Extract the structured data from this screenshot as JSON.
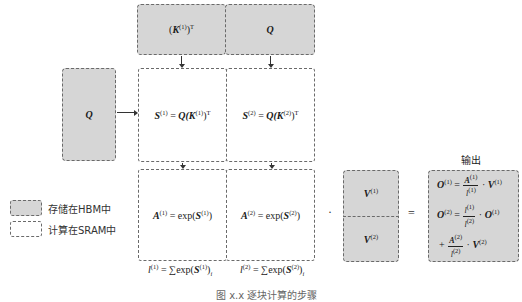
{
  "diagram": {
    "top_row": [
      {
        "text": "(K",
        "sup": "(1)",
        "close": ")",
        "sup2": "T"
      },
      {
        "text": "Q"
      }
    ],
    "left_input": {
      "text": "Q"
    },
    "s_row": [
      {
        "lhs": "S",
        "lhs_sup": "(1)",
        "eq": " = ",
        "rhs_a": "Q(K",
        "rhs_sup": "(1)",
        "rhs_close": ")",
        "rhs_sup2": "T"
      },
      {
        "lhs": "S",
        "lhs_sup": "(2)",
        "eq": " = ",
        "rhs_a": "Q(K",
        "rhs_sup": "(2)",
        "rhs_close": ")",
        "rhs_sup2": "T"
      }
    ],
    "a_row": [
      {
        "lhs": "A",
        "lhs_sup": "(1)",
        "eq": " = exp(",
        "arg": "S",
        "arg_sup": "(1)",
        "close": ")"
      },
      {
        "lhs": "A",
        "lhs_sup": "(2)",
        "eq": " = exp(",
        "arg": "S",
        "arg_sup": "(2)",
        "close": ")"
      }
    ],
    "l_formulas": [
      {
        "lhs": "l",
        "lhs_sup": "(1)",
        "eq": " = ∑exp(",
        "arg": "S",
        "arg_sup": "(1)",
        "close": ")",
        "sub": "i",
        "sum_sub": "i"
      },
      {
        "lhs": "l",
        "lhs_sup": "(2)",
        "eq": " = ∑exp(",
        "arg": "S",
        "arg_sup": "(2)",
        "close": ")",
        "sub": "i",
        "sum_sub": "i"
      }
    ],
    "dot_operator": "·",
    "equals_operator": "=",
    "v_blocks": [
      {
        "text": "V",
        "sup": "(1)"
      },
      {
        "text": "V",
        "sup": "(2)"
      }
    ],
    "output": {
      "title": "输出",
      "line1": {
        "lhs": "O",
        "lhs_sup": "(1)",
        "eq": " = ",
        "num": "A",
        "num_sup": "(1)",
        "den": "l",
        "den_sup": "(1)",
        "mul": " · ",
        "v": "V",
        "v_sup": "(1)"
      },
      "line2": {
        "lhs": "O",
        "lhs_sup": "(2)",
        "eq": " = ",
        "num": "l",
        "num_sup": "(1)",
        "den": "l",
        "den_sup": "(2)",
        "mul": " · ",
        "o": "O",
        "o_sup": "(1)"
      },
      "line3": {
        "plus": "+ ",
        "num": "A",
        "num_sup": "(2)",
        "den": "l",
        "den_sup": "(2)",
        "mul": " · ",
        "v": "V",
        "v_sup": "(2)"
      }
    }
  },
  "legend": {
    "items": [
      {
        "label": "存储在HBM中",
        "style": "hbm"
      },
      {
        "label": "计算在SRAM中",
        "style": "sram"
      }
    ]
  },
  "caption": {
    "text": "图 x.x  逐块计算的步骤"
  },
  "colors": {
    "hbm_fill": "#d6d6d6",
    "border": "#6a6a6a",
    "sram_fill": "#ffffff"
  }
}
